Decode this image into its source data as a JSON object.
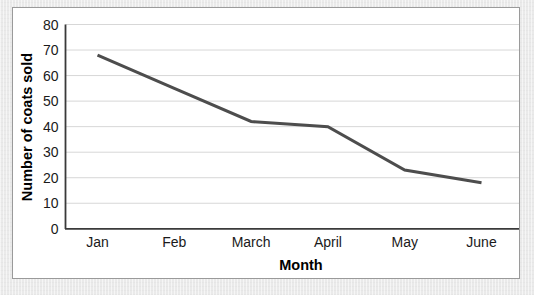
{
  "chart_data": {
    "type": "line",
    "title": "",
    "xlabel": "Month",
    "ylabel": "Number of coats sold",
    "categories": [
      "Jan",
      "Feb",
      "March",
      "April",
      "May",
      "June"
    ],
    "values": [
      68,
      55,
      42,
      40,
      23,
      18
    ],
    "series": [
      {
        "name": "Number of coats sold",
        "values": [
          68,
          55,
          42,
          40,
          23,
          18
        ]
      }
    ],
    "ylim": [
      0,
      80
    ],
    "y_ticks": [
      "0",
      "10",
      "20",
      "30",
      "40",
      "50",
      "60",
      "70",
      "80"
    ],
    "y_tick_values": [
      0,
      10,
      20,
      30,
      40,
      50,
      60,
      70,
      80
    ],
    "grid": "horizontal",
    "legend": "none",
    "line_color": "#4d4d4d",
    "gridline_color": "#d7d7d7",
    "axis_color": "#3a3a3a",
    "background_color": "#ffffff"
  },
  "card": {
    "border_color": "#9a9a9a",
    "background_color": "#ffffff"
  },
  "page": {
    "background_color": "#e9e9e9"
  }
}
